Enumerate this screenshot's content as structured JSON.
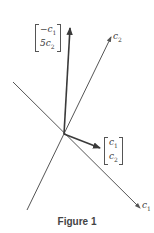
{
  "figure": {
    "caption": "Figure 1",
    "colors": {
      "line": "#555555",
      "vector": "#3a3a3a",
      "text": "#3a3a3a"
    },
    "axes": [
      {
        "name": "c1",
        "label_base": "c",
        "label_sub": "1",
        "from": [
          13,
          82
        ],
        "to": [
          140,
          208
        ]
      },
      {
        "name": "c2",
        "label_base": "c",
        "label_sub": "2",
        "from": [
          27,
          210
        ],
        "to": [
          111,
          37
        ]
      }
    ],
    "origin": [
      64,
      134
    ],
    "vectors": [
      {
        "name": "neg-c1-5c2",
        "to": [
          70,
          27
        ],
        "matrix": {
          "top_prefix": "−c",
          "top_sub": "1",
          "bottom_prefix": "5c",
          "bottom_sub": "2"
        }
      },
      {
        "name": "c1-c2",
        "to": [
          101,
          148
        ],
        "matrix": {
          "top_prefix": "c",
          "top_sub": "1",
          "bottom_prefix": "c",
          "bottom_sub": "2"
        }
      }
    ]
  }
}
